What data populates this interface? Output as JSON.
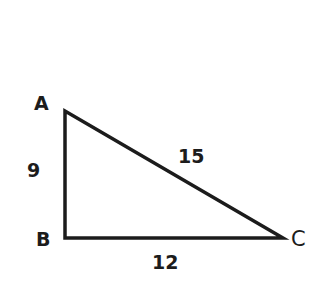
{
  "diagram": {
    "type": "right-triangle",
    "stroke_color": "#1c1c1c",
    "background": "#ffffff",
    "vertices": {
      "A": {
        "label": "A",
        "x": 65,
        "y": 111
      },
      "B": {
        "label": "B",
        "x": 65,
        "y": 238
      },
      "C": {
        "label": "C",
        "x": 283,
        "y": 238
      }
    },
    "sides": {
      "AB": {
        "label": "9"
      },
      "BC": {
        "label": "12"
      },
      "AC": {
        "label": "15"
      }
    },
    "right_angle_at": "B"
  }
}
